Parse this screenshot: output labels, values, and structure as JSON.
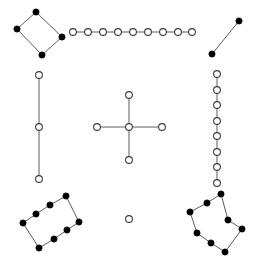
{
  "figure": {
    "width": 258,
    "height": 257,
    "background_color": "#ffffff",
    "edge_color": "#4a4a4a",
    "filled_node_fill": "#000000",
    "filled_node_stroke": "#000000",
    "open_node_fill": "#ffffff",
    "open_node_stroke": "#3c3c3c",
    "edge_width": 0.9,
    "filled_node_radius": 3.1,
    "open_node_radius": 3.4,
    "component_count": 9,
    "node_total": 47,
    "edge_total": 40
  },
  "chart_data": {
    "type": "scatter",
    "subtitle": "",
    "xlabel": "",
    "ylabel": "",
    "xlim": [
      0,
      258
    ],
    "ylim": [
      0,
      257
    ],
    "grid": false,
    "legend": "none",
    "axes_visible": false,
    "marker_styles": {
      "filled": "solid black disc",
      "open": "white disc with dark outline"
    },
    "components": [
      {
        "id": "top-left-diamond",
        "label": "Top-left diamond",
        "style": "filled",
        "shape": "cycle-4",
        "node_count": 4,
        "edge_count": 4,
        "nodes": [
          {
            "id": "a0",
            "x": 36,
            "y": 12
          },
          {
            "id": "a1",
            "x": 17,
            "y": 29
          },
          {
            "id": "a2",
            "x": 42,
            "y": 55
          },
          {
            "id": "a3",
            "x": 62,
            "y": 37
          }
        ],
        "edges": [
          [
            0,
            1
          ],
          [
            1,
            2
          ],
          [
            2,
            3
          ],
          [
            3,
            0
          ]
        ]
      },
      {
        "id": "top-horizontal-chain",
        "label": "Top horizontal chain",
        "style": "open",
        "shape": "path",
        "node_count": 9,
        "edge_count": 8,
        "nodes": [
          {
            "id": "b0",
            "x": 73,
            "y": 32
          },
          {
            "id": "b1",
            "x": 88,
            "y": 32
          },
          {
            "id": "b2",
            "x": 103,
            "y": 32
          },
          {
            "id": "b3",
            "x": 118,
            "y": 32
          },
          {
            "id": "b4",
            "x": 133,
            "y": 32
          },
          {
            "id": "b5",
            "x": 148,
            "y": 32
          },
          {
            "id": "b6",
            "x": 163,
            "y": 32
          },
          {
            "id": "b7",
            "x": 178,
            "y": 32
          },
          {
            "id": "b8",
            "x": 192,
            "y": 32
          }
        ],
        "edges": [
          [
            0,
            1
          ],
          [
            1,
            2
          ],
          [
            2,
            3
          ],
          [
            3,
            4
          ],
          [
            4,
            5
          ],
          [
            5,
            6
          ],
          [
            6,
            7
          ],
          [
            7,
            8
          ]
        ]
      },
      {
        "id": "top-right-segment",
        "label": "Top-right diagonal segment",
        "style": "filled",
        "shape": "path",
        "node_count": 2,
        "edge_count": 1,
        "nodes": [
          {
            "id": "c0",
            "x": 212,
            "y": 54
          },
          {
            "id": "c1",
            "x": 239,
            "y": 21
          }
        ],
        "edges": [
          [
            0,
            1
          ]
        ]
      },
      {
        "id": "left-vertical-chain",
        "label": "Left vertical chain",
        "style": "open",
        "shape": "path",
        "node_count": 3,
        "edge_count": 2,
        "nodes": [
          {
            "id": "d0",
            "x": 39,
            "y": 75
          },
          {
            "id": "d1",
            "x": 39,
            "y": 127
          },
          {
            "id": "d2",
            "x": 39,
            "y": 179
          }
        ],
        "edges": [
          [
            0,
            1
          ],
          [
            1,
            2
          ]
        ]
      },
      {
        "id": "center-star",
        "label": "Center star / plus",
        "style": "open",
        "shape": "star-4",
        "node_count": 5,
        "edge_count": 4,
        "nodes": [
          {
            "id": "e0",
            "x": 129,
            "y": 127
          },
          {
            "id": "e1",
            "x": 129,
            "y": 95
          },
          {
            "id": "e2",
            "x": 129,
            "y": 160
          },
          {
            "id": "e3",
            "x": 97,
            "y": 127
          },
          {
            "id": "e4",
            "x": 162,
            "y": 127
          }
        ],
        "edges": [
          [
            0,
            1
          ],
          [
            0,
            2
          ],
          [
            0,
            3
          ],
          [
            0,
            4
          ]
        ]
      },
      {
        "id": "right-vertical-chain",
        "label": "Right vertical chain",
        "style": "open",
        "shape": "path",
        "node_count": 8,
        "edge_count": 7,
        "nodes": [
          {
            "id": "f0",
            "x": 217,
            "y": 74
          },
          {
            "id": "f1",
            "x": 217,
            "y": 90
          },
          {
            "id": "f2",
            "x": 217,
            "y": 105
          },
          {
            "id": "f3",
            "x": 217,
            "y": 121
          },
          {
            "id": "f4",
            "x": 217,
            "y": 136
          },
          {
            "id": "f5",
            "x": 217,
            "y": 152
          },
          {
            "id": "f6",
            "x": 217,
            "y": 167
          },
          {
            "id": "f7",
            "x": 217,
            "y": 183
          }
        ],
        "edges": [
          [
            0,
            1
          ],
          [
            1,
            2
          ],
          [
            2,
            3
          ],
          [
            3,
            4
          ],
          [
            4,
            5
          ],
          [
            5,
            6
          ],
          [
            6,
            7
          ]
        ]
      },
      {
        "id": "bottom-left-rectangle",
        "label": "Bottom-left tilted rectangle",
        "style": "filled",
        "shape": "cycle-8",
        "node_count": 8,
        "edge_count": 8,
        "nodes": [
          {
            "id": "g0",
            "x": 50,
            "y": 205
          },
          {
            "id": "g1",
            "x": 36,
            "y": 214
          },
          {
            "id": "g2",
            "x": 23,
            "y": 223
          },
          {
            "id": "g3",
            "x": 39,
            "y": 248
          },
          {
            "id": "g4",
            "x": 54,
            "y": 239
          },
          {
            "id": "g5",
            "x": 67,
            "y": 230
          },
          {
            "id": "g6",
            "x": 79,
            "y": 222
          },
          {
            "id": "g7",
            "x": 66,
            "y": 196
          }
        ],
        "edges": [
          [
            7,
            0
          ],
          [
            0,
            1
          ],
          [
            1,
            2
          ],
          [
            2,
            3
          ],
          [
            3,
            4
          ],
          [
            4,
            5
          ],
          [
            5,
            6
          ],
          [
            6,
            7
          ]
        ]
      },
      {
        "id": "isolated-node",
        "label": "Isolated node",
        "style": "open",
        "shape": "singleton",
        "node_count": 1,
        "edge_count": 0,
        "nodes": [
          {
            "id": "h0",
            "x": 129,
            "y": 219
          }
        ],
        "edges": []
      },
      {
        "id": "bottom-right-rectangle",
        "label": "Bottom-right tilted rectangle",
        "style": "filled",
        "shape": "cycle-8",
        "node_count": 8,
        "edge_count": 8,
        "nodes": [
          {
            "id": "i0",
            "x": 228,
            "y": 220
          },
          {
            "id": "i1",
            "x": 242,
            "y": 229
          },
          {
            "id": "i2",
            "x": 225,
            "y": 252
          },
          {
            "id": "i3",
            "x": 211,
            "y": 243
          },
          {
            "id": "i4",
            "x": 197,
            "y": 233
          },
          {
            "id": "i5",
            "x": 190,
            "y": 212
          },
          {
            "id": "i6",
            "x": 207,
            "y": 203
          },
          {
            "id": "i7",
            "x": 221,
            "y": 194
          }
        ],
        "edges": [
          [
            0,
            1
          ],
          [
            1,
            2
          ],
          [
            2,
            3
          ],
          [
            3,
            4
          ],
          [
            4,
            5
          ],
          [
            5,
            6
          ],
          [
            6,
            7
          ],
          [
            7,
            0
          ]
        ]
      }
    ]
  }
}
